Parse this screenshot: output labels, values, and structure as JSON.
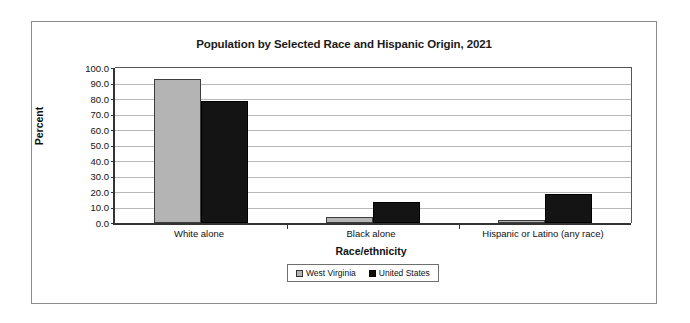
{
  "chart_data": {
    "type": "bar",
    "title": "Population by Selected Race and Hispanic Origin, 2021",
    "xlabel": "Race/ethnicity",
    "ylabel": "Percent",
    "ylim": [
      0.0,
      100.0
    ],
    "ytick_step": 10.0,
    "ytick_labels": [
      "100.0",
      "90.0",
      "80.0",
      "70.0",
      "60.0",
      "50.0",
      "40.0",
      "30.0",
      "20.0",
      "10.0",
      "0.0"
    ],
    "grid": true,
    "legend_position": "bottom-center",
    "categories": [
      "White alone",
      "Black alone",
      "Hispanic or Latino (any race)"
    ],
    "series": [
      {
        "name": "West Virginia",
        "color": "#b4b4b4",
        "values": [
          93.1,
          3.7,
          1.9
        ]
      },
      {
        "name": "United States",
        "color": "#141414",
        "values": [
          78.6,
          13.6,
          18.9
        ]
      }
    ]
  },
  "legend": {
    "items": [
      {
        "label": "West Virginia"
      },
      {
        "label": "United States"
      }
    ]
  }
}
